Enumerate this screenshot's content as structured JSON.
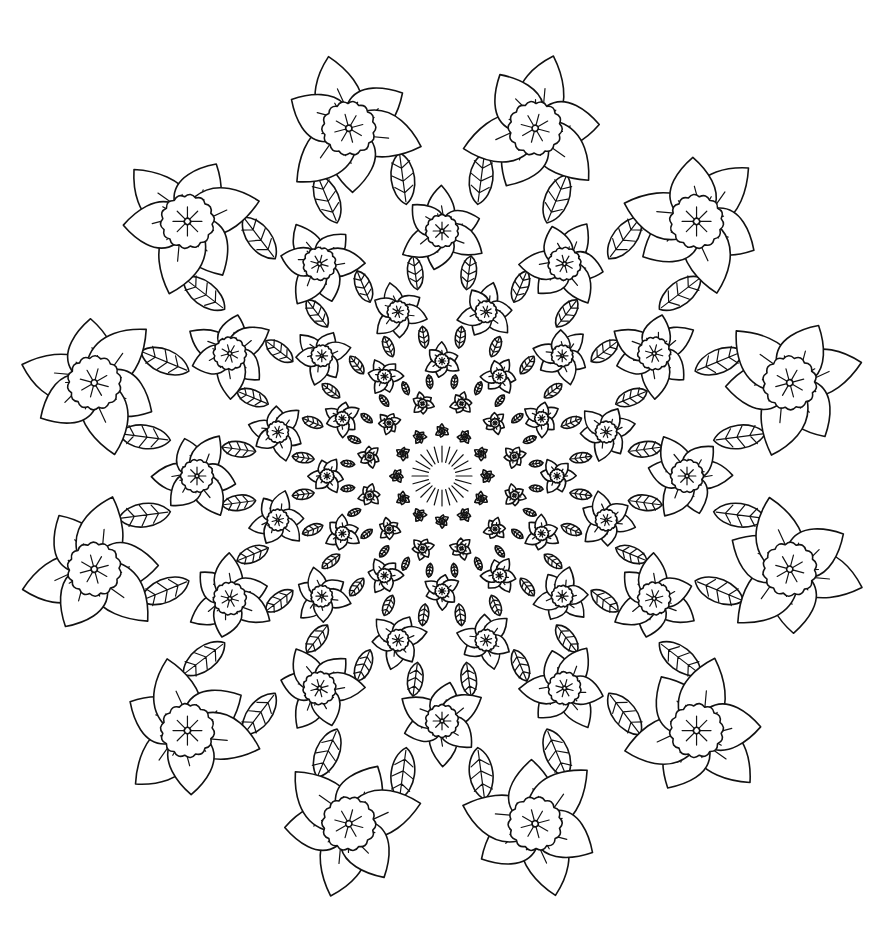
{
  "image": {
    "description": "Black and white line-art mandala coloring page of daffodil-like flowers arranged in concentric rings with leafy filler, converging to a dense star center",
    "background": "#ffffff",
    "line_color": "#111111"
  },
  "mandala": {
    "center": [
      442,
      476
    ],
    "rings": [
      {
        "name": "outer-flowers",
        "count": 12,
        "radius": 360,
        "size": 62,
        "offset_deg": -75
      },
      {
        "name": "second-ring",
        "count": 12,
        "radius": 245,
        "size": 38,
        "offset_deg": -90
      },
      {
        "name": "third-ring",
        "count": 12,
        "radius": 170,
        "size": 25,
        "offset_deg": -75
      },
      {
        "name": "fourth-ring",
        "count": 12,
        "radius": 115,
        "size": 16,
        "offset_deg": -90
      },
      {
        "name": "fifth-ring",
        "count": 12,
        "radius": 75,
        "size": 10,
        "offset_deg": -75
      },
      {
        "name": "inner-ring",
        "count": 12,
        "radius": 45,
        "size": 6,
        "offset_deg": -90
      }
    ],
    "leaf_rings": [
      {
        "count": 24,
        "radius": 300,
        "size": 26
      },
      {
        "count": 24,
        "radius": 205,
        "size": 17
      },
      {
        "count": 24,
        "radius": 140,
        "size": 11
      },
      {
        "count": 24,
        "radius": 95,
        "size": 7
      }
    ]
  }
}
